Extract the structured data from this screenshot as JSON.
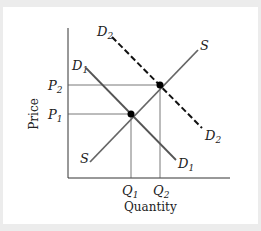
{
  "diagram": {
    "type": "supply-demand",
    "xlabel": "Quantity",
    "ylabel": "Price",
    "curves": [
      {
        "name": "S",
        "sub": "",
        "style": "solid"
      },
      {
        "name": "D",
        "sub": "1",
        "style": "solid"
      },
      {
        "name": "D",
        "sub": "2",
        "style": "dashed"
      }
    ],
    "prices": [
      {
        "name": "P",
        "sub": "1"
      },
      {
        "name": "P",
        "sub": "2"
      }
    ],
    "quantities": [
      {
        "name": "Q",
        "sub": "1"
      },
      {
        "name": "Q",
        "sub": "2"
      }
    ]
  }
}
